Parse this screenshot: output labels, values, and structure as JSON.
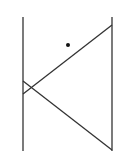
{
  "diagram": {
    "width": 128,
    "height": 151,
    "stroke_color": "#333333",
    "dot_color": "#111111",
    "lines": [
      {
        "name": "left-vertical-line",
        "x1": 23,
        "y1": 17,
        "x2": 23,
        "y2": 151
      },
      {
        "name": "right-vertical-line",
        "x1": 112,
        "y1": 17,
        "x2": 112,
        "y2": 151
      },
      {
        "name": "upper-diagonal-line",
        "x1": 112,
        "y1": 25,
        "x2": 23,
        "y2": 94
      },
      {
        "name": "lower-diagonal-line",
        "x1": 23,
        "y1": 81,
        "x2": 112,
        "y2": 150
      }
    ],
    "points": [
      {
        "name": "point-dot",
        "cx": 68,
        "cy": 45,
        "r": 2
      }
    ]
  }
}
